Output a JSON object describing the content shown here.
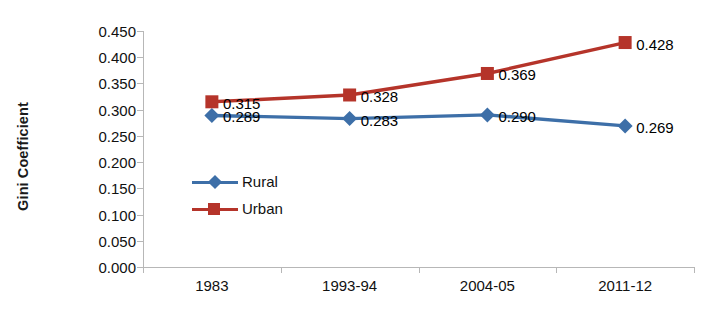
{
  "chart_data": {
    "type": "line",
    "title": "",
    "xlabel": "",
    "ylabel": "Gini Coefficient",
    "categories": [
      "1983",
      "1993-94",
      "2004-05",
      "2011-12"
    ],
    "series": [
      {
        "name": "Rural",
        "color": "#3D6FA8",
        "marker": "diamond",
        "values": [
          0.289,
          0.283,
          0.29,
          0.269
        ],
        "labels": [
          "0.289",
          "0.283",
          "0.290",
          "0.269"
        ]
      },
      {
        "name": "Urban",
        "color": "#B5342A",
        "marker": "square",
        "values": [
          0.315,
          0.328,
          0.369,
          0.428
        ],
        "labels": [
          "0.315",
          "0.328",
          "0.369",
          "0.428"
        ]
      }
    ],
    "ylim": [
      0.0,
      0.45
    ],
    "ytick_values": [
      0.45,
      0.4,
      0.35,
      0.3,
      0.25,
      0.2,
      0.15,
      0.1,
      0.05,
      0.0
    ],
    "ytick_labels": [
      "0.450",
      "0.400",
      "0.350",
      "0.300",
      "0.250",
      "0.200",
      "0.150",
      "0.100",
      "0.050",
      "0.000"
    ],
    "grid": false,
    "legend_position": "inside-left",
    "legend_entries": [
      "Rural",
      "Urban"
    ]
  },
  "colors": {
    "rural": "#3D6FA8",
    "urban": "#B5342A",
    "axis": "#b7b7b7",
    "text": "#111111",
    "background": "#ffffff"
  }
}
